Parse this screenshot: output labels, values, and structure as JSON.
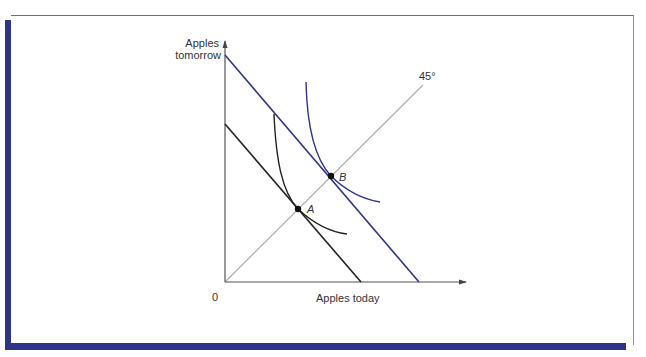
{
  "figure": {
    "y_axis_label_line1": "Apples",
    "y_axis_label_line2": "tomorrow",
    "x_axis_label": "Apples today",
    "origin_label": "0",
    "diagonal_label": "45°",
    "point_a_label": "A",
    "point_b_label": "B"
  },
  "colors": {
    "frame_accent": "#2e3589",
    "blue_lines": "#2e3589",
    "black_lines": "#222222",
    "diagonal": "#b0b0b0",
    "axes": "#555555"
  },
  "elements": {
    "budget_line_low": {
      "color": "black",
      "y_intercept_px": [
        225,
        124
      ],
      "x_intercept_px": [
        361,
        282
      ]
    },
    "budget_line_high": {
      "color": "blue",
      "y_intercept_px": [
        225,
        55
      ],
      "x_intercept_px": [
        419,
        282
      ]
    },
    "indifference_curve_low": {
      "color": "black",
      "tangent_point": "A"
    },
    "indifference_curve_high": {
      "color": "blue",
      "tangent_point": "B"
    },
    "diagonal_line": {
      "label": "45°",
      "from_origin": true
    }
  }
}
